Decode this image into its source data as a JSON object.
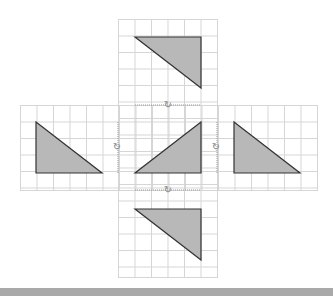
{
  "diagram": {
    "colors": {
      "fill": "#b8b8b8",
      "stroke": "#333333",
      "grid": "#cfcfcf",
      "bar": "#a9a9a9"
    },
    "triangles": [
      {
        "name": "top",
        "points": "135,37 201,37 201,88"
      },
      {
        "name": "left",
        "points": "36,122 36,173 102,173"
      },
      {
        "name": "center",
        "points": "135,173 201,173 201,122"
      },
      {
        "name": "right",
        "points": "234,122 234,173 300,173"
      },
      {
        "name": "bottom",
        "points": "135,209 201,209 201,260"
      }
    ],
    "rotation_markers": {
      "top": "↻",
      "left": "↻",
      "right": "↻",
      "bottom": "↻"
    }
  }
}
